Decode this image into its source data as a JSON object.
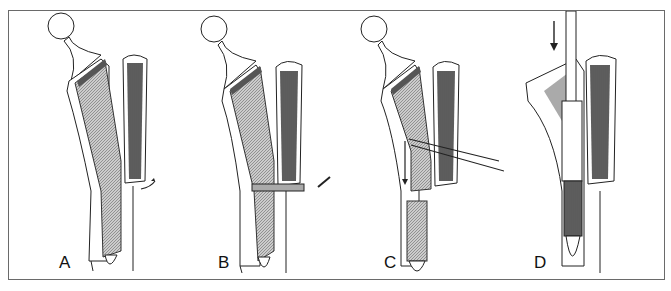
{
  "figure": {
    "panels": [
      {
        "id": "A",
        "label": "A",
        "step": "cortical flap opened (curved arrow)"
      },
      {
        "id": "B",
        "label": "B",
        "step": "drilling / fixation through flap (arrow)"
      },
      {
        "id": "C",
        "label": "C",
        "step": "wires passed, stem pushed down (arrow)"
      },
      {
        "id": "D",
        "label": "D",
        "step": "new stem driven into canal (downward arrow)"
      }
    ]
  },
  "colors": {
    "frame": "#6a6a6a",
    "ink": "#222222",
    "hatch": "#8a8a8a",
    "dark_hatch": "#4a4a4a",
    "background": "#ffffff"
  }
}
